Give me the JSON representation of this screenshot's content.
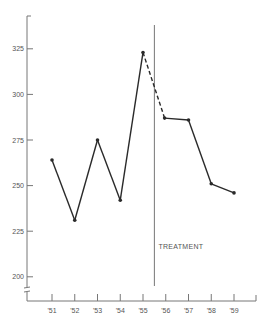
{
  "chart_data": {
    "type": "line",
    "title": "",
    "xlabel": "",
    "ylabel": "",
    "categories": [
      "'51",
      "'52",
      "'53",
      "'54",
      "'55",
      "'56",
      "'57",
      "'58",
      "'59"
    ],
    "series": [
      {
        "name": "values",
        "x": [
          1951,
          1952,
          1953,
          1954,
          1955,
          1955.95,
          1957,
          1958,
          1959
        ],
        "values": [
          264,
          231,
          275,
          242,
          323,
          287,
          286,
          251,
          246
        ]
      }
    ],
    "dashed_segment": {
      "from_index": 4,
      "to_index": 5
    },
    "yticks": [
      200,
      225,
      250,
      275,
      300,
      325
    ],
    "ylim": [
      190,
      340
    ],
    "y_axis_break": true,
    "annotations": [
      {
        "type": "vline",
        "x": 1955.5,
        "label": "TREATMENT"
      }
    ],
    "grid": false,
    "legend": "none"
  },
  "labels": {
    "treatment": "TREATMENT"
  }
}
